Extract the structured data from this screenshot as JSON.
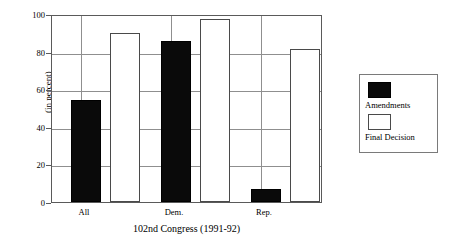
{
  "chart_data": {
    "type": "bar",
    "title": "",
    "categories": [
      "All",
      "Dem.",
      "Rep."
    ],
    "series": [
      {
        "name": "Amendments",
        "color": "#000000",
        "values": [
          55,
          86.5,
          7
        ]
      },
      {
        "name": "Final Decision",
        "color": "#ffffff",
        "values": [
          91,
          98.5,
          82
        ]
      }
    ],
    "xlabel": "102nd Congress (1991-92)",
    "ylabel": "(in percent)",
    "ylim": [
      0,
      100
    ],
    "yticks": [
      0,
      20,
      40,
      60,
      80,
      100
    ],
    "ytick_labels": [
      "0",
      "20",
      "40",
      "60",
      "80",
      "100"
    ],
    "grid": true,
    "legend_position": "right"
  },
  "axes": {
    "y_label": "(in percent)",
    "x_label": "102nd Congress (1991-92)",
    "y_ticks": [
      "0",
      "20",
      "40",
      "60",
      "80",
      "100"
    ],
    "x_ticks": [
      "All",
      "Dem.",
      "Rep."
    ]
  },
  "legend": {
    "entries": [
      {
        "label": "Amendments",
        "swatch": "black-square"
      },
      {
        "label": "Final Decision",
        "swatch": "white-square"
      }
    ]
  }
}
